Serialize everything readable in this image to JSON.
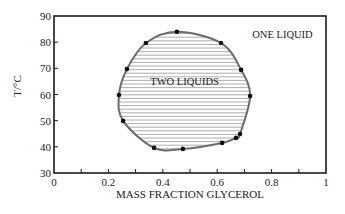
{
  "chart_data": {
    "type": "scatter",
    "title": "",
    "xlabel": "MASS FRACTION GLYCEROL",
    "ylabel": "T/°C",
    "xlim": [
      0,
      1
    ],
    "ylim": [
      30,
      90
    ],
    "x_tick_labels": [
      "0",
      "0.2",
      "0.4",
      "0.6",
      "0.8",
      "1"
    ],
    "x_ticks": [
      0,
      0.1,
      0.2,
      0.3,
      0.4,
      0.5,
      0.6,
      0.7,
      0.8,
      0.9,
      1.0
    ],
    "y_tick_labels": [
      "30",
      "40",
      "50",
      "60",
      "70",
      "80",
      "90"
    ],
    "y_ticks": [
      30,
      40,
      50,
      60,
      70,
      80,
      90
    ],
    "grid": false,
    "legend": null,
    "annotations": [
      {
        "text": "ONE LIQUID",
        "x": 0.84,
        "y": 83
      },
      {
        "text": "TWO LIQUIDS",
        "x": 0.48,
        "y": 65
      }
    ],
    "series": [
      {
        "name": "coexistence boundary (closed loop)",
        "points": [
          {
            "x": 0.452,
            "y": 84.0
          },
          {
            "x": 0.614,
            "y": 79.7
          },
          {
            "x": 0.688,
            "y": 69.4
          },
          {
            "x": 0.721,
            "y": 59.4
          },
          {
            "x": 0.684,
            "y": 44.9
          },
          {
            "x": 0.669,
            "y": 43.4
          },
          {
            "x": 0.618,
            "y": 41.5
          },
          {
            "x": 0.474,
            "y": 39.2
          },
          {
            "x": 0.368,
            "y": 39.6
          },
          {
            "x": 0.254,
            "y": 49.9
          },
          {
            "x": 0.239,
            "y": 59.8
          },
          {
            "x": 0.268,
            "y": 69.7
          },
          {
            "x": 0.338,
            "y": 79.7
          }
        ]
      }
    ],
    "shaded_region": "interior of loop hatched with horizontal lines (two-liquid region)"
  },
  "colors": {
    "axis": "#1a1a1a",
    "curve": "#6b6b6b",
    "points": "#111111",
    "hatch": "#8a8a8a"
  }
}
